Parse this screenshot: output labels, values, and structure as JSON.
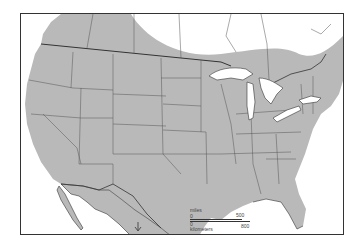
{
  "map": {
    "title": "",
    "type": "species range map",
    "region": "United States, southern Canada and northern Mexico",
    "colors": {
      "range_fill": "#b9b9b9",
      "land_outline": "#333333",
      "water": "#ffffff",
      "frame": "#333333"
    },
    "shaded_range": "Most of contiguous United States and southern Canada"
  },
  "scale_bar": {
    "miles_label": "miles",
    "kilometers_label": "kilometers",
    "miles_start": "0",
    "miles_end": "500",
    "km_start": "0",
    "km_end": "800"
  }
}
